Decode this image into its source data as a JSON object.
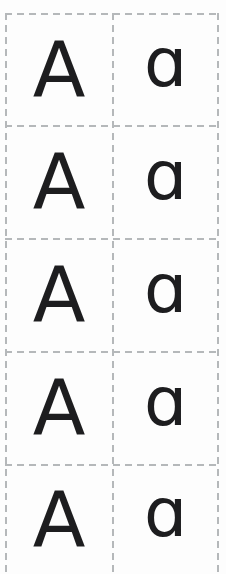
{
  "sheet": {
    "letters": {
      "uppercase": "A",
      "lowercase": "a"
    },
    "cards": {
      "rows": [
        {
          "uppercase": "A",
          "lowercase": "a",
          "lowercase_glyph": "ɑ"
        },
        {
          "uppercase": "A",
          "lowercase": "a",
          "lowercase_glyph": "ɑ"
        },
        {
          "uppercase": "A",
          "lowercase": "a",
          "lowercase_glyph": "ɑ"
        },
        {
          "uppercase": "A",
          "lowercase": "a",
          "lowercase_glyph": "ɑ"
        },
        {
          "uppercase": "A",
          "lowercase": "a",
          "lowercase_glyph": "ɑ"
        }
      ]
    },
    "colors": {
      "background": "#fdfdfd",
      "dash": "#b5b8ba",
      "letter": "#1d1d1f"
    }
  }
}
